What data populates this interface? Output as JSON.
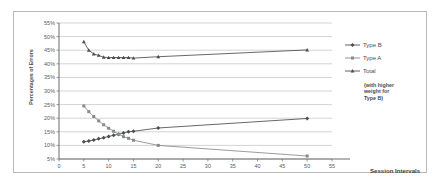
{
  "chart_data": {
    "type": "line",
    "title": "",
    "subtitle": "",
    "xlabel": "Session Intervals",
    "ylabel": "Percentages of Errors",
    "xlim": [
      0,
      55
    ],
    "ylim": [
      5,
      55
    ],
    "x_ticks": [
      0,
      5,
      10,
      15,
      20,
      25,
      30,
      35,
      40,
      45,
      50,
      55
    ],
    "x_tick_labels": [
      "0",
      "5",
      "10",
      "15",
      "20",
      "25",
      "30",
      "35",
      "40",
      "45",
      "50",
      "55"
    ],
    "y_ticks": [
      5,
      10,
      15,
      20,
      25,
      30,
      35,
      40,
      45,
      50,
      55
    ],
    "y_tick_labels": [
      "5%",
      "10%",
      "15%",
      "20%",
      "25%",
      "30%",
      "35%",
      "40%",
      "45%",
      "50%",
      "55%"
    ],
    "grid": "horizontal",
    "legend_position": "right",
    "legend_note": [
      "(with higher",
      "weight for",
      "Type B)"
    ],
    "series": [
      {
        "name": "Type B",
        "color": "#4a4d51",
        "marker": "diamond",
        "x": [
          5,
          6,
          7,
          8,
          9,
          10,
          11,
          12,
          13,
          14,
          15,
          20,
          50
        ],
        "values": [
          11.3,
          11.6,
          12.0,
          12.4,
          12.8,
          13.3,
          13.7,
          14.1,
          14.6,
          15.0,
          15.2,
          16.4,
          19.9
        ]
      },
      {
        "name": "Type A",
        "color": "#88898c",
        "marker": "square",
        "x": [
          5,
          6,
          7,
          8,
          9,
          10,
          11,
          12,
          13,
          14,
          15,
          20,
          50
        ],
        "values": [
          24.5,
          22.4,
          20.6,
          19.0,
          17.6,
          16.3,
          15.2,
          14.1,
          13.2,
          12.6,
          11.9,
          10.0,
          6.1
        ]
      },
      {
        "name": "Total",
        "color": "#4a4d51",
        "marker": "triangle",
        "x": [
          5,
          6,
          7,
          8,
          9,
          10,
          11,
          12,
          13,
          14,
          15,
          20,
          50
        ],
        "values": [
          48.1,
          45.0,
          43.6,
          43.1,
          42.4,
          42.3,
          42.3,
          42.3,
          42.3,
          42.3,
          42.1,
          42.6,
          45.1
        ]
      }
    ]
  },
  "axes": {
    "y_title": "Percentages of Errors",
    "x_title": "Session Intervals"
  }
}
